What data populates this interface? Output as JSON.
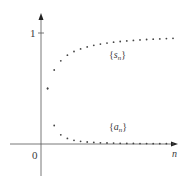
{
  "chart_data": {
    "type": "scatter",
    "title": "",
    "xlabel": "n",
    "ylabel": "",
    "x_tick_labels": [
      "0"
    ],
    "y_tick_labels": [
      "1"
    ],
    "xlim": [
      0,
      21
    ],
    "ylim": [
      -0.3,
      1.15
    ],
    "grid": false,
    "legend": "inline labels",
    "series": [
      {
        "name": "{s_n}",
        "label_main": "s",
        "label_sub": "n",
        "formula": "n/(n+1)",
        "x": [
          1,
          2,
          3,
          4,
          5,
          6,
          7,
          8,
          9,
          10,
          11,
          12,
          13,
          14,
          15,
          16,
          17,
          18,
          19,
          20
        ],
        "values": [
          0.5,
          0.667,
          0.75,
          0.8,
          0.833,
          0.857,
          0.875,
          0.889,
          0.9,
          0.909,
          0.917,
          0.923,
          0.929,
          0.933,
          0.938,
          0.941,
          0.944,
          0.947,
          0.95,
          0.952
        ]
      },
      {
        "name": "{a_n}",
        "label_main": "a",
        "label_sub": "n",
        "formula": "1/(n(n+1))",
        "x": [
          1,
          2,
          3,
          4,
          5,
          6,
          7,
          8,
          9,
          10,
          11,
          12,
          13,
          14,
          15,
          16,
          17,
          18,
          19,
          20
        ],
        "values": [
          0.5,
          0.167,
          0.083,
          0.05,
          0.033,
          0.024,
          0.018,
          0.014,
          0.011,
          0.009,
          0.008,
          0.006,
          0.005,
          0.005,
          0.004,
          0.004,
          0.003,
          0.003,
          0.003,
          0.002
        ]
      }
    ]
  },
  "labels": {
    "origin": "0",
    "y_one": "1",
    "x_axis": "n",
    "s_label_main": "s",
    "s_label_sub": "n",
    "a_label_main": "a",
    "a_label_sub": "n",
    "brace_open": "{",
    "brace_close": "}"
  }
}
